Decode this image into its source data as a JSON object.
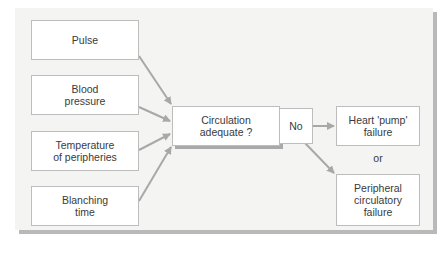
{
  "diagram": {
    "inputs": [
      {
        "id": "pulse",
        "label": "Pulse"
      },
      {
        "id": "blood-pressure",
        "label": "Blood\npressure"
      },
      {
        "id": "temperature",
        "label": "Temperature\nof peripheries"
      },
      {
        "id": "blanching",
        "label": "Blanching\ntime"
      }
    ],
    "decision": {
      "label": "Circulation\nadequate ?"
    },
    "branch_label": "No",
    "outcomes": [
      {
        "id": "heart-pump-failure",
        "label": "Heart 'pump'\nfailure"
      },
      {
        "id": "peripheral-failure",
        "label": "Peripheral\ncirculatory\nfailure"
      }
    ],
    "connector_text": "or",
    "colors": {
      "panel_bg": "#f4f4f3",
      "box_bg": "#ffffff",
      "box_border": "#bdbdbd",
      "arrow": "#a8a8a8",
      "shadow": "#b9b9b9",
      "text": "#3a3a3a"
    }
  }
}
